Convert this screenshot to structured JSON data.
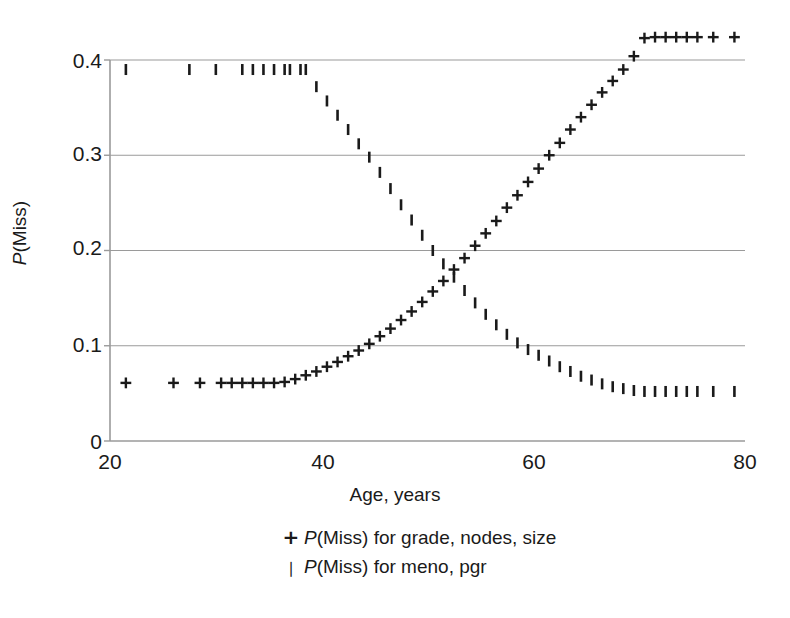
{
  "chart_data": {
    "type": "scatter",
    "title": "",
    "xlabel": "Age, years",
    "ylabel": "P(Miss)",
    "ylabel_parts": {
      "italic": "P",
      "rest": "(Miss)"
    },
    "xlim": [
      20,
      80
    ],
    "ylim": [
      0,
      0.45
    ],
    "xticks": [
      20,
      40,
      60,
      80
    ],
    "xtick_labels": [
      "20",
      "40",
      "60",
      "80"
    ],
    "yticks": [
      0,
      0.1,
      0.2,
      0.3,
      0.4
    ],
    "ytick_labels": [
      "0",
      "0.1",
      "0.2",
      "0.3",
      "0.4"
    ],
    "grid": "horizontal",
    "grid_color": "#9a9a9a",
    "axis_color": "#9a9a9a",
    "marker_color": "#1a1a1a",
    "legend_position": "below-axes",
    "series": [
      {
        "name": "P(Miss) for grade, nodes, size",
        "marker": "plus",
        "x": [
          21.5,
          26,
          28.5,
          30.5,
          31.5,
          32.5,
          33.5,
          34.5,
          35.5,
          36.5,
          37.5,
          38.5,
          39.5,
          40.5,
          41.5,
          42.5,
          43.5,
          44.5,
          45.5,
          46.5,
          47.5,
          48.5,
          49.5,
          50.5,
          51.5,
          52.5,
          53.5,
          54.5,
          55.5,
          56.5,
          57.5,
          58.5,
          59.5,
          60.5,
          61.5,
          62.5,
          63.5,
          64.5,
          65.5,
          66.5,
          67.5,
          68.5,
          69.5,
          70.5,
          71.5,
          72.5,
          73.5,
          74.5,
          75.5,
          77,
          79
        ],
        "y": [
          0.061,
          0.061,
          0.061,
          0.061,
          0.061,
          0.061,
          0.061,
          0.061,
          0.061,
          0.062,
          0.065,
          0.069,
          0.073,
          0.078,
          0.083,
          0.089,
          0.095,
          0.102,
          0.11,
          0.118,
          0.127,
          0.136,
          0.146,
          0.157,
          0.168,
          0.18,
          0.192,
          0.205,
          0.218,
          0.231,
          0.245,
          0.258,
          0.272,
          0.286,
          0.3,
          0.313,
          0.327,
          0.34,
          0.353,
          0.366,
          0.378,
          0.39,
          0.404,
          0.423,
          0.424,
          0.424,
          0.424,
          0.424,
          0.424,
          0.424,
          0.424
        ]
      },
      {
        "name": "P(Miss) for meno, pgr",
        "marker": "bar",
        "x": [
          21.5,
          27.5,
          30,
          32.5,
          33.5,
          34.5,
          35.5,
          36.5,
          37,
          38,
          38.5,
          39.5,
          40.5,
          41.5,
          42.5,
          43.5,
          44.5,
          45.5,
          46.5,
          47.5,
          48.5,
          49.5,
          50.5,
          51.5,
          52.5,
          53.5,
          54.5,
          55.5,
          56.5,
          57.5,
          58.5,
          59.5,
          60.5,
          61.5,
          62.5,
          63.5,
          64.5,
          65.5,
          66.5,
          67.5,
          68.5,
          69.5,
          70.5,
          71.5,
          72.5,
          73.5,
          74.5,
          75.5,
          77,
          79
        ],
        "y": [
          0.39,
          0.39,
          0.39,
          0.39,
          0.39,
          0.39,
          0.39,
          0.39,
          0.39,
          0.39,
          0.39,
          0.372,
          0.357,
          0.342,
          0.327,
          0.312,
          0.298,
          0.282,
          0.265,
          0.248,
          0.232,
          0.216,
          0.2,
          0.186,
          0.172,
          0.158,
          0.145,
          0.133,
          0.122,
          0.112,
          0.103,
          0.096,
          0.09,
          0.084,
          0.078,
          0.073,
          0.068,
          0.064,
          0.06,
          0.057,
          0.055,
          0.053,
          0.052,
          0.052,
          0.052,
          0.052,
          0.052,
          0.052,
          0.052,
          0.052
        ]
      }
    ]
  },
  "legend": {
    "items": [
      {
        "marker": "+",
        "label_italic": "P",
        "label_rest": "(Miss) for grade, nodes, size"
      },
      {
        "marker": "❘",
        "label_italic": "P",
        "label_rest": "(Miss) for meno, pgr"
      }
    ]
  }
}
